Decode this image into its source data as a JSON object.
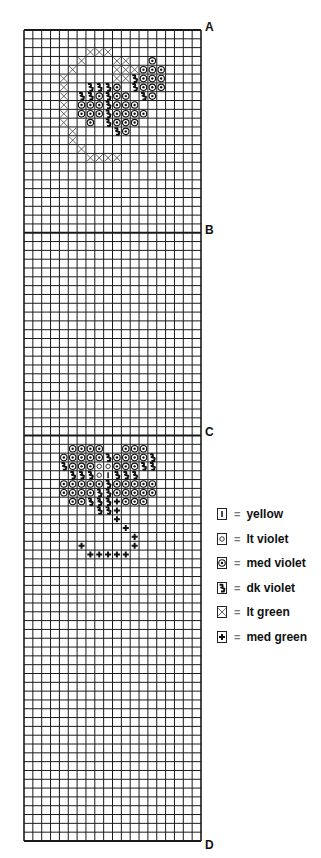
{
  "chart": {
    "cols": 20,
    "rows": 92,
    "cell_w": 8.85,
    "cell_h": 8.815,
    "section_lines": [
      0,
      23,
      46,
      92
    ],
    "markers": [
      {
        "label": "A",
        "row": 0
      },
      {
        "label": "B",
        "row": 23
      },
      {
        "label": "C",
        "row": 46
      },
      {
        "label": "D",
        "row": 92
      }
    ]
  },
  "symbols": {
    "yellow": "bar",
    "lt_violet": "circle",
    "med_violet": "dot-circle",
    "dk_violet": "zigzag",
    "lt_green": "x",
    "med_green": "plus"
  },
  "legend": [
    {
      "symbol": "yellow",
      "eq": "=",
      "label": "yellow"
    },
    {
      "symbol": "lt_violet",
      "eq": "=",
      "label": "lt violet"
    },
    {
      "symbol": "med_violet",
      "eq": "=",
      "label": "med violet"
    },
    {
      "symbol": "dk_violet",
      "eq": "=",
      "label": "dk violet"
    },
    {
      "symbol": "lt_green",
      "eq": "=",
      "label": "lt green"
    },
    {
      "symbol": "med_green",
      "eq": "=",
      "label": "med green"
    }
  ],
  "motifs": [
    {
      "name": "motif-top",
      "cells": [
        [
          2,
          7,
          "lt_green"
        ],
        [
          2,
          8,
          "lt_green"
        ],
        [
          2,
          9,
          "lt_green"
        ],
        [
          3,
          6,
          "lt_green"
        ],
        [
          3,
          10,
          "lt_green"
        ],
        [
          3,
          11,
          "lt_green"
        ],
        [
          3,
          14,
          "med_violet"
        ],
        [
          4,
          5,
          "lt_green"
        ],
        [
          4,
          10,
          "lt_green"
        ],
        [
          4,
          11,
          "lt_green"
        ],
        [
          4,
          12,
          "lt_green"
        ],
        [
          4,
          13,
          "med_violet"
        ],
        [
          4,
          14,
          "med_violet"
        ],
        [
          4,
          15,
          "med_violet"
        ],
        [
          5,
          4,
          "lt_green"
        ],
        [
          5,
          10,
          "lt_green"
        ],
        [
          5,
          11,
          "lt_green"
        ],
        [
          5,
          12,
          "dk_violet"
        ],
        [
          5,
          13,
          "med_violet"
        ],
        [
          5,
          14,
          "med_violet"
        ],
        [
          5,
          15,
          "med_violet"
        ],
        [
          6,
          4,
          "lt_green"
        ],
        [
          6,
          7,
          "dk_violet"
        ],
        [
          6,
          8,
          "dk_violet"
        ],
        [
          6,
          9,
          "dk_violet"
        ],
        [
          6,
          10,
          "med_violet"
        ],
        [
          6,
          12,
          "dk_violet"
        ],
        [
          6,
          13,
          "med_violet"
        ],
        [
          6,
          14,
          "med_violet"
        ],
        [
          6,
          15,
          "med_violet"
        ],
        [
          7,
          4,
          "lt_green"
        ],
        [
          7,
          6,
          "dk_violet"
        ],
        [
          7,
          7,
          "dk_violet"
        ],
        [
          7,
          8,
          "med_violet"
        ],
        [
          7,
          9,
          "dk_violet"
        ],
        [
          7,
          10,
          "med_violet"
        ],
        [
          7,
          11,
          "med_violet"
        ],
        [
          7,
          13,
          "dk_violet"
        ],
        [
          7,
          14,
          "med_violet"
        ],
        [
          8,
          4,
          "lt_green"
        ],
        [
          8,
          6,
          "med_violet"
        ],
        [
          8,
          7,
          "med_violet"
        ],
        [
          8,
          8,
          "med_violet"
        ],
        [
          8,
          9,
          "dk_violet"
        ],
        [
          8,
          10,
          "med_violet"
        ],
        [
          8,
          11,
          "med_violet"
        ],
        [
          8,
          12,
          "med_violet"
        ],
        [
          9,
          4,
          "lt_green"
        ],
        [
          9,
          6,
          "med_violet"
        ],
        [
          9,
          7,
          "med_violet"
        ],
        [
          9,
          8,
          "med_violet"
        ],
        [
          9,
          9,
          "dk_violet"
        ],
        [
          9,
          10,
          "med_violet"
        ],
        [
          9,
          11,
          "med_violet"
        ],
        [
          9,
          12,
          "med_violet"
        ],
        [
          9,
          13,
          "med_violet"
        ],
        [
          10,
          4,
          "lt_green"
        ],
        [
          10,
          7,
          "med_violet"
        ],
        [
          10,
          9,
          "dk_violet"
        ],
        [
          10,
          10,
          "med_violet"
        ],
        [
          10,
          11,
          "med_violet"
        ],
        [
          10,
          12,
          "med_violet"
        ],
        [
          11,
          5,
          "lt_green"
        ],
        [
          11,
          10,
          "dk_violet"
        ],
        [
          11,
          11,
          "med_violet"
        ],
        [
          12,
          5,
          "lt_green"
        ],
        [
          13,
          6,
          "lt_green"
        ],
        [
          14,
          7,
          "lt_green"
        ],
        [
          14,
          8,
          "lt_green"
        ],
        [
          14,
          9,
          "lt_green"
        ],
        [
          14,
          10,
          "lt_green"
        ]
      ]
    },
    {
      "name": "motif-bottom",
      "cells": [
        [
          47,
          5,
          "med_violet"
        ],
        [
          47,
          6,
          "med_violet"
        ],
        [
          47,
          7,
          "med_violet"
        ],
        [
          47,
          8,
          "med_violet"
        ],
        [
          47,
          11,
          "med_violet"
        ],
        [
          47,
          12,
          "med_violet"
        ],
        [
          47,
          13,
          "med_violet"
        ],
        [
          48,
          4,
          "med_violet"
        ],
        [
          48,
          5,
          "med_violet"
        ],
        [
          48,
          6,
          "med_violet"
        ],
        [
          48,
          7,
          "med_violet"
        ],
        [
          48,
          8,
          "med_violet"
        ],
        [
          48,
          9,
          "dk_violet"
        ],
        [
          48,
          10,
          "med_violet"
        ],
        [
          48,
          11,
          "med_violet"
        ],
        [
          48,
          12,
          "med_violet"
        ],
        [
          48,
          13,
          "med_violet"
        ],
        [
          48,
          14,
          "dk_violet"
        ],
        [
          49,
          4,
          "dk_violet"
        ],
        [
          49,
          5,
          "med_violet"
        ],
        [
          49,
          6,
          "med_violet"
        ],
        [
          49,
          7,
          "med_violet"
        ],
        [
          49,
          8,
          "lt_violet"
        ],
        [
          49,
          9,
          "lt_violet"
        ],
        [
          49,
          10,
          "med_violet"
        ],
        [
          49,
          11,
          "med_violet"
        ],
        [
          49,
          12,
          "med_violet"
        ],
        [
          49,
          13,
          "dk_violet"
        ],
        [
          49,
          14,
          "dk_violet"
        ],
        [
          50,
          5,
          "dk_violet"
        ],
        [
          50,
          6,
          "dk_violet"
        ],
        [
          50,
          7,
          "dk_violet"
        ],
        [
          50,
          8,
          "lt_violet"
        ],
        [
          50,
          9,
          "yellow"
        ],
        [
          50,
          10,
          "dk_violet"
        ],
        [
          50,
          11,
          "dk_violet"
        ],
        [
          50,
          12,
          "dk_violet"
        ],
        [
          51,
          4,
          "med_violet"
        ],
        [
          51,
          5,
          "med_violet"
        ],
        [
          51,
          6,
          "med_violet"
        ],
        [
          51,
          7,
          "med_violet"
        ],
        [
          51,
          8,
          "med_violet"
        ],
        [
          51,
          9,
          "dk_violet"
        ],
        [
          51,
          10,
          "med_violet"
        ],
        [
          51,
          11,
          "med_violet"
        ],
        [
          51,
          12,
          "med_violet"
        ],
        [
          51,
          13,
          "med_violet"
        ],
        [
          51,
          14,
          "med_violet"
        ],
        [
          52,
          4,
          "med_violet"
        ],
        [
          52,
          5,
          "med_violet"
        ],
        [
          52,
          6,
          "med_violet"
        ],
        [
          52,
          7,
          "med_violet"
        ],
        [
          52,
          8,
          "dk_violet"
        ],
        [
          52,
          9,
          "dk_violet"
        ],
        [
          52,
          10,
          "med_violet"
        ],
        [
          52,
          11,
          "med_violet"
        ],
        [
          52,
          12,
          "med_violet"
        ],
        [
          52,
          13,
          "med_violet"
        ],
        [
          52,
          14,
          "med_violet"
        ],
        [
          53,
          5,
          "med_violet"
        ],
        [
          53,
          6,
          "med_violet"
        ],
        [
          53,
          7,
          "dk_violet"
        ],
        [
          53,
          8,
          "dk_violet"
        ],
        [
          53,
          9,
          "dk_violet"
        ],
        [
          53,
          10,
          "med_green"
        ],
        [
          53,
          11,
          "med_violet"
        ],
        [
          53,
          12,
          "med_violet"
        ],
        [
          53,
          13,
          "med_violet"
        ],
        [
          54,
          8,
          "dk_violet"
        ],
        [
          54,
          9,
          "dk_violet"
        ],
        [
          54,
          10,
          "med_green"
        ],
        [
          55,
          10,
          "med_green"
        ],
        [
          56,
          11,
          "med_green"
        ],
        [
          57,
          12,
          "med_green"
        ],
        [
          58,
          6,
          "med_green"
        ],
        [
          58,
          12,
          "med_green"
        ],
        [
          59,
          7,
          "med_green"
        ],
        [
          59,
          8,
          "med_green"
        ],
        [
          59,
          9,
          "med_green"
        ],
        [
          59,
          10,
          "med_green"
        ],
        [
          59,
          11,
          "med_green"
        ]
      ]
    }
  ]
}
